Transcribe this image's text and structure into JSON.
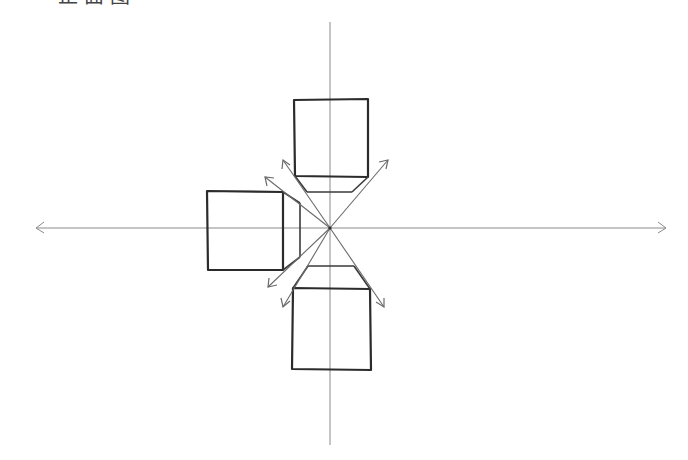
{
  "title": {
    "text": "正面图",
    "clipped": true
  },
  "diagram": {
    "type": "one-point-perspective-sketch",
    "vanishing_point": {
      "x": 330,
      "y": 228
    },
    "axes": {
      "horizontal": {
        "y": 228,
        "x1": 36,
        "x2": 666,
        "arrows": [
          "left",
          "right"
        ]
      },
      "vertical": {
        "x": 330,
        "y1": 22,
        "y2": 445,
        "arrows": []
      }
    },
    "boxes": [
      {
        "name": "top-box",
        "front": {
          "x1": 294,
          "y1": 99,
          "x2": 368,
          "y2": 177
        },
        "back_edge": {
          "x1": 307,
          "y1": 192,
          "x2": 352,
          "y2": 192
        }
      },
      {
        "name": "left-box",
        "front": {
          "x1": 207,
          "y1": 190,
          "x2": 283,
          "y2": 270
        },
        "back_edge": {
          "x1": 300,
          "y1": 203,
          "x2": 300,
          "y2": 257
        }
      },
      {
        "name": "bottom-box",
        "front": {
          "x1": 292,
          "y1": 288,
          "x2": 371,
          "y2": 370
        },
        "back_edge": {
          "x1": 308,
          "y1": 266,
          "x2": 354,
          "y2": 266
        }
      }
    ],
    "rays": [
      {
        "to": {
          "x": 283,
          "y": 160
        }
      },
      {
        "to": {
          "x": 388,
          "y": 160
        }
      },
      {
        "to": {
          "x": 265,
          "y": 177
        }
      },
      {
        "to": {
          "x": 268,
          "y": 287
        }
      },
      {
        "to": {
          "x": 283,
          "y": 307
        }
      },
      {
        "to": {
          "x": 384,
          "y": 307
        }
      }
    ],
    "colors": {
      "stroke_dark": "#2b2b2b",
      "stroke_light": "#8a8a8a",
      "background": "#ffffff"
    }
  }
}
